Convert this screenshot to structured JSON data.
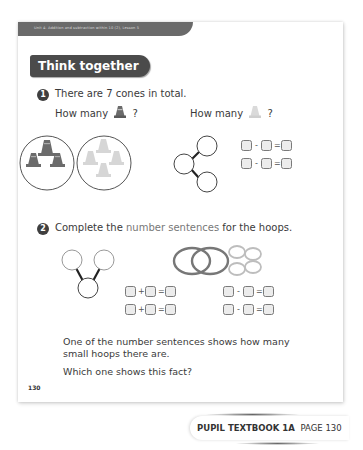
{
  "header": {
    "unit_line": "Unit 4: Addition and subtraction within 10 (2), Lesson 5",
    "section_title": "Think together"
  },
  "question1": {
    "number": "1",
    "text": "There are 7 cones in total.",
    "prompt_dark": "How many",
    "prompt_light": "How many",
    "question_mark": "?",
    "dark_cone_count": 3,
    "light_cone_count": 4,
    "part_whole": {
      "whole": "7",
      "parts": [
        "",
        ""
      ]
    },
    "equations": [
      {
        "op": "-",
        "eq": "="
      },
      {
        "op": "-",
        "eq": "="
      }
    ]
  },
  "question2": {
    "number": "2",
    "text_before": "Complete the ",
    "text_highlight": "number sentences",
    "text_after": " for the hoops.",
    "part_whole": {
      "whole": "",
      "parts": [
        "",
        ""
      ]
    },
    "big_hoops": 2,
    "small_hoops": 4,
    "equations_left": [
      {
        "op": "+",
        "eq": "="
      },
      {
        "op": "+",
        "eq": "="
      }
    ],
    "equations_right": [
      {
        "op": "-",
        "eq": "="
      },
      {
        "op": "-",
        "eq": "="
      }
    ],
    "follow_up_1": "One of the number sentences shows how many",
    "follow_up_2": "small hoops there are.",
    "follow_up_3": "Which one shows this fact?"
  },
  "footer": {
    "page_number": "130",
    "book_label": "PUPIL TEXTBOOK 1A",
    "page_label": "PAGE 130"
  },
  "colors": {
    "banner": "#6a6a6a",
    "badge": "#4b4b4b",
    "dark_cone": "#6b6b6b",
    "light_cone": "#d6d6d6",
    "highlight_text": "#777777"
  }
}
